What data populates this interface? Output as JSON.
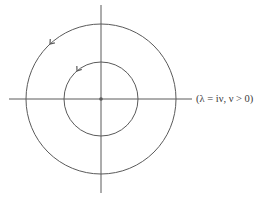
{
  "diagram": {
    "type": "complex-plane contour diagram",
    "label": "(λ = iν, ν > 0)",
    "stroke_color": "#5a5a5a",
    "center": {
      "x": 101,
      "y": 99
    },
    "axes": {
      "horizontal": {
        "x1": 9,
        "x2": 192,
        "y": 99
      },
      "vertical": {
        "x": 101,
        "y1": 5,
        "y2": 193
      }
    },
    "circles": [
      {
        "name": "outer",
        "radius": 75,
        "direction": "counterclockwise"
      },
      {
        "name": "inner",
        "radius": 37,
        "direction": "counterclockwise"
      }
    ],
    "origin_marker": "dot"
  }
}
